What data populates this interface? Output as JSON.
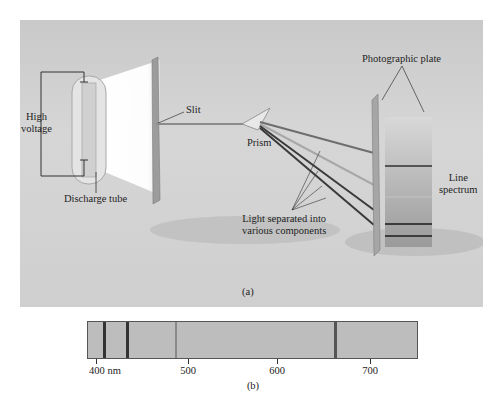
{
  "figure": {
    "panel_a": {
      "caption": "(a)",
      "labels": {
        "high_voltage": [
          "High",
          "voltage"
        ],
        "discharge_tube": "Discharge tube",
        "slit": "Slit",
        "prism": "Prism",
        "photographic_plate": "Photographic plate",
        "line_spectrum": [
          "Line",
          "spectrum"
        ],
        "light_separated": [
          "Light separated into",
          "various components"
        ]
      }
    },
    "panel_b": {
      "caption": "(b)",
      "axis_ticks": [
        "400 nm",
        "500",
        "600",
        "700"
      ],
      "tick_values_nm": [
        400,
        500,
        600,
        700
      ],
      "range_nm": [
        390,
        755
      ],
      "lines_nm": [
        410,
        434,
        486,
        656
      ]
    }
  },
  "colors": {
    "background": "#d2d2d2",
    "spectrum_bar": "#bdbdbd",
    "dark_line": "#333333",
    "light_line": "#8a8a8a"
  }
}
